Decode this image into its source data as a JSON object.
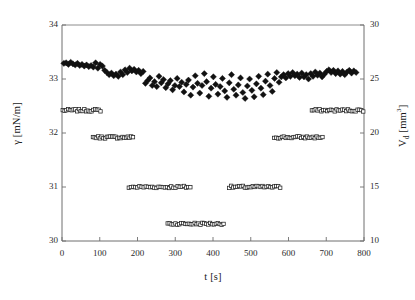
{
  "chart_data": {
    "type": "scatter",
    "title": "",
    "xlabel": "t [s]",
    "ylabel": "γ [mN/m]",
    "y2label": "V_d [mm³]",
    "xlim": [
      0,
      800
    ],
    "ylim": [
      30,
      34
    ],
    "y2lim": [
      10,
      30
    ],
    "xticks": [
      0,
      100,
      200,
      300,
      400,
      500,
      600,
      700,
      800
    ],
    "yticks": [
      30,
      31,
      32,
      33,
      34
    ],
    "y2ticks": [
      10,
      15,
      20,
      25,
      30
    ],
    "xtick_labels": [
      "0",
      "100",
      "200",
      "300",
      "400",
      "500",
      "600",
      "700",
      "800"
    ],
    "ytick_labels": [
      "30",
      "31",
      "32",
      "33",
      "34"
    ],
    "y2tick_labels": [
      "10",
      "15",
      "20",
      "25",
      "30"
    ],
    "grid": false,
    "legend": null,
    "legend_position": "none",
    "marker_color": "#111111",
    "axis_color": "#6e6e6e",
    "background": "#ffffff",
    "series": [
      {
        "name": "γ [mN/m]",
        "axis": "left",
        "marker": "filled-diamond",
        "marker_size": 3.1,
        "color": "#111111",
        "points": [
          [
            5,
            33.29
          ],
          [
            11,
            33.3
          ],
          [
            17,
            33.27
          ],
          [
            23,
            33.31
          ],
          [
            29,
            33.28
          ],
          [
            35,
            33.26
          ],
          [
            41,
            33.29
          ],
          [
            47,
            33.25
          ],
          [
            53,
            33.27
          ],
          [
            59,
            33.24
          ],
          [
            65,
            33.26
          ],
          [
            71,
            33.23
          ],
          [
            77,
            33.25
          ],
          [
            83,
            33.22
          ],
          [
            89,
            33.3
          ],
          [
            95,
            33.2
          ],
          [
            101,
            33.27
          ],
          [
            107,
            33.24
          ],
          [
            113,
            33.16
          ],
          [
            119,
            33.12
          ],
          [
            125,
            33.08
          ],
          [
            131,
            33.11
          ],
          [
            137,
            33.06
          ],
          [
            143,
            33.09
          ],
          [
            149,
            33.05
          ],
          [
            155,
            33.13
          ],
          [
            161,
            33.08
          ],
          [
            167,
            33.17
          ],
          [
            173,
            33.12
          ],
          [
            179,
            33.2
          ],
          [
            185,
            33.15
          ],
          [
            191,
            33.18
          ],
          [
            197,
            33.13
          ],
          [
            203,
            33.16
          ],
          [
            209,
            33.1
          ],
          [
            215,
            33.14
          ],
          [
            221,
            32.92
          ],
          [
            227,
            32.97
          ],
          [
            233,
            33.02
          ],
          [
            239,
            32.88
          ],
          [
            245,
            32.95
          ],
          [
            251,
            32.86
          ],
          [
            257,
            33.05
          ],
          [
            263,
            32.93
          ],
          [
            269,
            32.99
          ],
          [
            275,
            32.84
          ],
          [
            281,
            32.91
          ],
          [
            287,
            32.97
          ],
          [
            293,
            32.8
          ],
          [
            299,
            32.88
          ],
          [
            305,
            33.01
          ],
          [
            311,
            32.86
          ],
          [
            317,
            32.94
          ],
          [
            323,
            32.76
          ],
          [
            329,
            32.9
          ],
          [
            335,
            32.98
          ],
          [
            341,
            32.7
          ],
          [
            347,
            32.85
          ],
          [
            353,
            33.06
          ],
          [
            359,
            32.92
          ],
          [
            365,
            32.74
          ],
          [
            371,
            32.88
          ],
          [
            377,
            33.1
          ],
          [
            383,
            32.95
          ],
          [
            389,
            32.68
          ],
          [
            395,
            32.83
          ],
          [
            401,
            33.04
          ],
          [
            407,
            32.9
          ],
          [
            413,
            32.72
          ],
          [
            419,
            32.86
          ],
          [
            425,
            33.01
          ],
          [
            431,
            32.78
          ],
          [
            437,
            32.66
          ],
          [
            443,
            32.93
          ],
          [
            449,
            33.08
          ],
          [
            455,
            32.81
          ],
          [
            461,
            32.7
          ],
          [
            467,
            32.89
          ],
          [
            473,
            33.02
          ],
          [
            479,
            32.75
          ],
          [
            485,
            32.64
          ],
          [
            491,
            32.87
          ],
          [
            497,
            33.0
          ],
          [
            503,
            32.79
          ],
          [
            509,
            32.67
          ],
          [
            515,
            32.91
          ],
          [
            521,
            33.05
          ],
          [
            527,
            32.83
          ],
          [
            533,
            32.71
          ],
          [
            539,
            32.96
          ],
          [
            545,
            33.09
          ],
          [
            551,
            32.88
          ],
          [
            557,
            32.77
          ],
          [
            563,
            33.01
          ],
          [
            569,
            33.12
          ],
          [
            575,
            32.94
          ],
          [
            581,
            33.04
          ],
          [
            587,
            33.08
          ],
          [
            593,
            33.02
          ],
          [
            599,
            33.1
          ],
          [
            605,
            33.05
          ],
          [
            611,
            33.12
          ],
          [
            617,
            33.06
          ],
          [
            623,
            33.09
          ],
          [
            629,
            33.03
          ],
          [
            635,
            33.11
          ],
          [
            641,
            33.04
          ],
          [
            647,
            33.08
          ],
          [
            653,
            33.0
          ],
          [
            659,
            33.1
          ],
          [
            665,
            33.05
          ],
          [
            671,
            33.13
          ],
          [
            677,
            33.07
          ],
          [
            683,
            33.11
          ],
          [
            689,
            33.04
          ],
          [
            695,
            33.09
          ],
          [
            701,
            33.14
          ],
          [
            707,
            33.17
          ],
          [
            713,
            33.12
          ],
          [
            719,
            33.16
          ],
          [
            725,
            33.1
          ],
          [
            731,
            33.15
          ],
          [
            737,
            33.09
          ],
          [
            743,
            33.14
          ],
          [
            749,
            33.08
          ],
          [
            755,
            33.13
          ],
          [
            761,
            33.16
          ],
          [
            767,
            33.11
          ],
          [
            773,
            33.15
          ],
          [
            779,
            33.12
          ]
        ]
      },
      {
        "name": "V_d [mm³]",
        "axis": "right",
        "marker": "open-square",
        "marker_size": 3.4,
        "color": "#222222",
        "segments": [
          {
            "t_start": 2,
            "t_end": 102,
            "value": 22.1,
            "n": 22
          },
          {
            "t_start": 82,
            "t_end": 188,
            "value": 19.6,
            "n": 24
          },
          {
            "t_start": 177,
            "t_end": 340,
            "value": 15.0,
            "n": 30
          },
          {
            "t_start": 280,
            "t_end": 428,
            "value": 11.6,
            "n": 30
          },
          {
            "t_start": 443,
            "t_end": 578,
            "value": 15.0,
            "n": 27
          },
          {
            "t_start": 562,
            "t_end": 690,
            "value": 19.6,
            "n": 26
          },
          {
            "t_start": 662,
            "t_end": 798,
            "value": 22.1,
            "n": 28
          }
        ]
      }
    ]
  },
  "axes": {
    "x_label": "t [s]",
    "y_left_label": "γ [mN/m]",
    "y_right_label": "V",
    "y_right_sub": "d",
    "y_right_unit": " [mm",
    "y_right_sup": "3",
    "y_right_close": "]"
  }
}
